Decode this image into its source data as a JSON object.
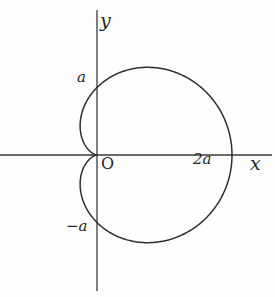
{
  "figure": {
    "kind": "cardioid-plot",
    "background_color": "#fefefe",
    "curve_color": "#2e2e2e",
    "axis_color": "#3a3a3a"
  },
  "labels": {
    "y_axis": "y",
    "x_axis": "x",
    "origin": "O",
    "y_positive_tick": "a",
    "y_negative_tick": "−a",
    "x_positive_tick": "2a"
  },
  "chart_data": {
    "type": "line",
    "title": "",
    "xlabel": "x",
    "ylabel": "y",
    "curve_name": "cardioid",
    "polar_equation": "r = a(1 + cosθ)",
    "grid": false,
    "legend": false,
    "axis_ticks": {
      "x": [
        "2a"
      ],
      "y": [
        "a",
        "−a"
      ]
    },
    "annotations": [
      {
        "text": "O",
        "x": 0,
        "y": 0,
        "role": "origin-label"
      },
      {
        "text": "a",
        "x": 0,
        "y": 1,
        "role": "y-intercept-upper"
      },
      {
        "text": "−a",
        "x": 0,
        "y": -1,
        "role": "y-intercept-lower"
      },
      {
        "text": "2a",
        "x": 2,
        "y": 0,
        "role": "x-intercept-right"
      }
    ],
    "key_points": [
      {
        "label": "cusp",
        "x": 0,
        "y": 0
      },
      {
        "label": "y-intercept-upper",
        "x": 0,
        "y": 1
      },
      {
        "label": "y-intercept-lower",
        "x": 0,
        "y": -1
      },
      {
        "label": "rightmost",
        "x": 2,
        "y": 0
      },
      {
        "label": "topmost",
        "x": 0.75,
        "y": 1.3
      },
      {
        "label": "bottommost",
        "x": 0.75,
        "y": -1.3
      },
      {
        "label": "leftmost",
        "x": -0.25,
        "y": 0.43
      },
      {
        "label": "leftmost-lower",
        "x": -0.25,
        "y": -0.43
      }
    ],
    "xlim": [
      -1.25,
      3.4
    ],
    "ylim": [
      -2.1,
      2.0
    ],
    "x_axis_extent_px": [
      0,
      272
    ],
    "y_axis_extent_px": [
      10,
      291
    ],
    "origin_px": {
      "x": 97,
      "y": 155
    },
    "unit_px": 67.5
  }
}
